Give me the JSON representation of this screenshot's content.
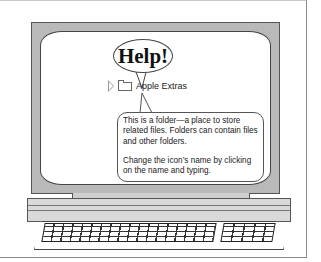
{
  "help_balloon": {
    "title": "Help!"
  },
  "finder_item": {
    "disclosure": "disclosure-triangle",
    "icon": "folder-icon",
    "name": "Apple Extras"
  },
  "info_balloon": {
    "paragraph1_line1": "This is a folder—a place to store",
    "paragraph1_line2": "related files.  Folders can contain files",
    "paragraph1_line3": "and other folders.",
    "paragraph2_line1": "Change the icon’s name by clicking",
    "paragraph2_line2": "on the name and typing."
  },
  "colors": {
    "bezel": "#b9b9b9",
    "screen": "#ffffff",
    "outline": "#444444"
  }
}
